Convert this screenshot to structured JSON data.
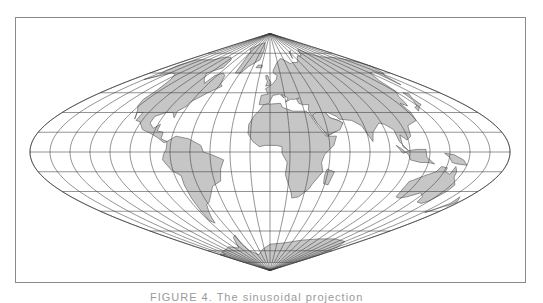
{
  "map": {
    "projection": "sinusoidal",
    "center": {
      "x": 270,
      "y": 152
    },
    "scale": {
      "px_per_deg_x": 1.3333,
      "px_per_deg_y": 1.3167
    },
    "graticule": {
      "lat_step": 15,
      "lon_step": 15
    },
    "colors": {
      "land": "#c6c6c6",
      "coast": "#555555",
      "graticule": "#3a3a3a",
      "frame": "#8a8a8a",
      "background": "#ffffff"
    },
    "continents": [
      {
        "name": "North America",
        "coords": [
          [
            -168,
            66
          ],
          [
            -160,
            70
          ],
          [
            -140,
            70
          ],
          [
            -125,
            70
          ],
          [
            -110,
            72
          ],
          [
            -95,
            72
          ],
          [
            -85,
            70
          ],
          [
            -80,
            64
          ],
          [
            -95,
            60
          ],
          [
            -88,
            56
          ],
          [
            -80,
            52
          ],
          [
            -78,
            58
          ],
          [
            -70,
            60
          ],
          [
            -64,
            58
          ],
          [
            -60,
            52
          ],
          [
            -56,
            50
          ],
          [
            -66,
            45
          ],
          [
            -70,
            42
          ],
          [
            -76,
            38
          ],
          [
            -76,
            35
          ],
          [
            -81,
            31
          ],
          [
            -80,
            26
          ],
          [
            -82,
            28
          ],
          [
            -84,
            30
          ],
          [
            -90,
            30
          ],
          [
            -97,
            27
          ],
          [
            -97,
            22
          ],
          [
            -92,
            18
          ],
          [
            -88,
            21
          ],
          [
            -88,
            16
          ],
          [
            -83,
            15
          ],
          [
            -83,
            10
          ],
          [
            -78,
            8
          ],
          [
            -80,
            7
          ],
          [
            -86,
            11
          ],
          [
            -92,
            14
          ],
          [
            -100,
            17
          ],
          [
            -106,
            23
          ],
          [
            -110,
            24
          ],
          [
            -110,
            30
          ],
          [
            -115,
            30
          ],
          [
            -112,
            25
          ],
          [
            -117,
            32
          ],
          [
            -121,
            35
          ],
          [
            -124,
            40
          ],
          [
            -124,
            47
          ],
          [
            -130,
            55
          ],
          [
            -138,
            59
          ],
          [
            -148,
            60
          ],
          [
            -155,
            58
          ],
          [
            -165,
            55
          ],
          [
            -158,
            58
          ],
          [
            -165,
            62
          ]
        ]
      },
      {
        "name": "Greenland",
        "coords": [
          [
            -52,
            60
          ],
          [
            -44,
            60
          ],
          [
            -38,
            65
          ],
          [
            -22,
            70
          ],
          [
            -20,
            78
          ],
          [
            -30,
            83
          ],
          [
            -50,
            82
          ],
          [
            -65,
            80
          ],
          [
            -72,
            78
          ],
          [
            -60,
            76
          ],
          [
            -55,
            70
          ]
        ]
      },
      {
        "name": "South America",
        "coords": [
          [
            -78,
            8
          ],
          [
            -72,
            12
          ],
          [
            -62,
            10
          ],
          [
            -52,
            5
          ],
          [
            -50,
            0
          ],
          [
            -44,
            -2
          ],
          [
            -35,
            -6
          ],
          [
            -38,
            -13
          ],
          [
            -40,
            -22
          ],
          [
            -48,
            -26
          ],
          [
            -53,
            -33
          ],
          [
            -58,
            -38
          ],
          [
            -62,
            -40
          ],
          [
            -65,
            -45
          ],
          [
            -68,
            -50
          ],
          [
            -70,
            -54
          ],
          [
            -74,
            -52
          ],
          [
            -73,
            -45
          ],
          [
            -72,
            -35
          ],
          [
            -71,
            -25
          ],
          [
            -70,
            -18
          ],
          [
            -76,
            -14
          ],
          [
            -81,
            -6
          ],
          [
            -80,
            -2
          ],
          [
            -78,
            2
          ]
        ]
      },
      {
        "name": "Europe-Asia",
        "coords": [
          [
            -10,
            36
          ],
          [
            -9,
            43
          ],
          [
            -2,
            44
          ],
          [
            -5,
            48
          ],
          [
            2,
            51
          ],
          [
            5,
            53
          ],
          [
            8,
            55
          ],
          [
            10,
            58
          ],
          [
            5,
            60
          ],
          [
            5,
            62
          ],
          [
            14,
            68
          ],
          [
            24,
            71
          ],
          [
            30,
            70
          ],
          [
            40,
            67
          ],
          [
            44,
            68
          ],
          [
            55,
            68
          ],
          [
            60,
            70
          ],
          [
            70,
            73
          ],
          [
            80,
            73
          ],
          [
            100,
            78
          ],
          [
            112,
            74
          ],
          [
            130,
            72
          ],
          [
            150,
            72
          ],
          [
            170,
            70
          ],
          [
            180,
            68
          ],
          [
            180,
            65
          ],
          [
            170,
            60
          ],
          [
            162,
            58
          ],
          [
            156,
            51
          ],
          [
            160,
            61
          ],
          [
            150,
            60
          ],
          [
            140,
            54
          ],
          [
            136,
            46
          ],
          [
            130,
            42
          ],
          [
            128,
            38
          ],
          [
            126,
            35
          ],
          [
            122,
            37
          ],
          [
            122,
            30
          ],
          [
            120,
            24
          ],
          [
            110,
            20
          ],
          [
            108,
            12
          ],
          [
            104,
            9
          ],
          [
            100,
            13
          ],
          [
            100,
            4
          ],
          [
            104,
            1
          ],
          [
            98,
            8
          ],
          [
            97,
            17
          ],
          [
            92,
            21
          ],
          [
            88,
            22
          ],
          [
            80,
            15
          ],
          [
            78,
            8
          ],
          [
            73,
            20
          ],
          [
            67,
            24
          ],
          [
            57,
            25
          ],
          [
            56,
            27
          ],
          [
            50,
            30
          ],
          [
            48,
            30
          ],
          [
            50,
            26
          ],
          [
            56,
            24
          ],
          [
            59,
            22
          ],
          [
            52,
            16
          ],
          [
            44,
            12
          ],
          [
            42,
            16
          ],
          [
            35,
            28
          ],
          [
            34,
            32
          ],
          [
            36,
            36
          ],
          [
            30,
            36
          ],
          [
            27,
            37
          ],
          [
            26,
            40
          ],
          [
            29,
            41
          ],
          [
            24,
            40
          ],
          [
            20,
            40
          ],
          [
            15,
            38
          ],
          [
            18,
            41
          ],
          [
            12,
            44
          ],
          [
            14,
            41
          ],
          [
            10,
            44
          ],
          [
            3,
            43
          ],
          [
            -1,
            37
          ],
          [
            -5,
            36
          ]
        ]
      },
      {
        "name": "Africa",
        "coords": [
          [
            -17,
            21
          ],
          [
            -13,
            28
          ],
          [
            -9,
            32
          ],
          [
            -6,
            36
          ],
          [
            10,
            37
          ],
          [
            11,
            34
          ],
          [
            20,
            31
          ],
          [
            32,
            31
          ],
          [
            34,
            28
          ],
          [
            38,
            20
          ],
          [
            43,
            12
          ],
          [
            51,
            12
          ],
          [
            48,
            5
          ],
          [
            41,
            -2
          ],
          [
            39,
            -8
          ],
          [
            41,
            -15
          ],
          [
            35,
            -24
          ],
          [
            33,
            -28
          ],
          [
            26,
            -34
          ],
          [
            20,
            -35
          ],
          [
            18,
            -30
          ],
          [
            14,
            -22
          ],
          [
            12,
            -17
          ],
          [
            13,
            -8
          ],
          [
            9,
            -1
          ],
          [
            9,
            4
          ],
          [
            5,
            5
          ],
          [
            -4,
            5
          ],
          [
            -8,
            4
          ],
          [
            -13,
            8
          ],
          [
            -17,
            14
          ]
        ]
      },
      {
        "name": "Madagascar",
        "coords": [
          [
            44,
            -13
          ],
          [
            50,
            -15
          ],
          [
            48,
            -25
          ],
          [
            44,
            -24
          ],
          [
            43,
            -18
          ]
        ]
      },
      {
        "name": "Arabia",
        "coords": [
          [
            36,
            28
          ],
          [
            40,
            30
          ],
          [
            48,
            30
          ],
          [
            50,
            26
          ],
          [
            56,
            24
          ],
          [
            59,
            22
          ],
          [
            55,
            17
          ],
          [
            45,
            13
          ],
          [
            42,
            16
          ],
          [
            38,
            22
          ]
        ]
      },
      {
        "name": "Australia",
        "coords": [
          [
            113,
            -22
          ],
          [
            114,
            -34
          ],
          [
            118,
            -35
          ],
          [
            124,
            -34
          ],
          [
            132,
            -31
          ],
          [
            138,
            -34
          ],
          [
            140,
            -38
          ],
          [
            146,
            -39
          ],
          [
            150,
            -37
          ],
          [
            153,
            -30
          ],
          [
            153,
            -25
          ],
          [
            146,
            -19
          ],
          [
            145,
            -15
          ],
          [
            142,
            -11
          ],
          [
            141,
            -17
          ],
          [
            136,
            -15
          ],
          [
            136,
            -12
          ],
          [
            131,
            -11
          ],
          [
            129,
            -15
          ],
          [
            122,
            -18
          ],
          [
            114,
            -22
          ]
        ]
      },
      {
        "name": "Antarctica",
        "coords": [
          [
            -180,
            -84
          ],
          [
            -180,
            -78
          ],
          [
            -160,
            -78
          ],
          [
            -150,
            -76
          ],
          [
            -120,
            -74
          ],
          [
            -100,
            -72
          ],
          [
            -80,
            -73
          ],
          [
            -65,
            -65
          ],
          [
            -58,
            -63
          ],
          [
            -62,
            -70
          ],
          [
            -60,
            -75
          ],
          [
            -40,
            -78
          ],
          [
            -20,
            -74
          ],
          [
            0,
            -70
          ],
          [
            30,
            -69
          ],
          [
            60,
            -67
          ],
          [
            90,
            -66
          ],
          [
            120,
            -66
          ],
          [
            150,
            -68
          ],
          [
            165,
            -72
          ],
          [
            170,
            -76
          ],
          [
            180,
            -78
          ],
          [
            180,
            -84
          ]
        ]
      },
      {
        "name": "Indonesia",
        "coords": [
          [
            95,
            5
          ],
          [
            98,
            3
          ],
          [
            104,
            -2
          ],
          [
            106,
            -6
          ],
          [
            114,
            -8
          ],
          [
            120,
            -8
          ],
          [
            125,
            -9
          ],
          [
            118,
            -4
          ],
          [
            117,
            2
          ],
          [
            110,
            2
          ],
          [
            104,
            1
          ],
          [
            100,
            -1
          ]
        ]
      },
      {
        "name": "New Guinea",
        "coords": [
          [
            131,
            -1
          ],
          [
            138,
            -2
          ],
          [
            146,
            -6
          ],
          [
            150,
            -10
          ],
          [
            142,
            -9
          ],
          [
            138,
            -8
          ],
          [
            135,
            -4
          ]
        ]
      },
      {
        "name": "Japan",
        "coords": [
          [
            130,
            31
          ],
          [
            135,
            34
          ],
          [
            140,
            36
          ],
          [
            141,
            41
          ],
          [
            145,
            44
          ],
          [
            141,
            45
          ],
          [
            139,
            40
          ],
          [
            135,
            35
          ],
          [
            131,
            34
          ]
        ]
      },
      {
        "name": "UK",
        "coords": [
          [
            -5,
            50
          ],
          [
            1,
            51
          ],
          [
            1,
            53
          ],
          [
            -2,
            56
          ],
          [
            -3,
            58
          ],
          [
            -6,
            58
          ],
          [
            -5,
            55
          ],
          [
            -3,
            54
          ],
          [
            -4,
            52
          ]
        ]
      },
      {
        "name": "New Zealand",
        "coords": [
          [
            172,
            -34
          ],
          [
            178,
            -38
          ],
          [
            176,
            -41
          ],
          [
            174,
            -41
          ],
          [
            167,
            -46
          ],
          [
            170,
            -44
          ],
          [
            174,
            -39
          ]
        ]
      },
      {
        "name": "Iceland",
        "coords": [
          [
            -24,
            64
          ],
          [
            -14,
            64
          ],
          [
            -14,
            66
          ],
          [
            -22,
            66
          ]
        ]
      },
      {
        "name": "Svalbard-NovayaZemlya",
        "coords": [
          [
            52,
            71
          ],
          [
            58,
            75
          ],
          [
            68,
            77
          ],
          [
            60,
            76
          ],
          [
            54,
            73
          ]
        ]
      }
    ]
  },
  "caption": {
    "text": "FIGURE 4.  The sinusoidal projection"
  }
}
